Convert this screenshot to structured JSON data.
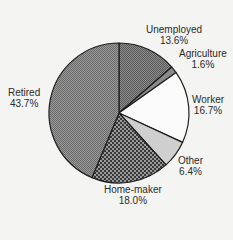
{
  "chart_data": {
    "type": "pie",
    "title": "",
    "start_angle_deg": 0,
    "direction": "clockwise",
    "slices": [
      {
        "label": "Unemployed",
        "value": 13.6,
        "value_label": "13.6%",
        "pattern": "fine-dots-dark"
      },
      {
        "label": "Agriculture",
        "value": 1.6,
        "value_label": "1.6%",
        "pattern": "medium-gray"
      },
      {
        "label": "Worker",
        "value": 16.7,
        "value_label": "16.7%",
        "pattern": "white"
      },
      {
        "label": "Other",
        "value": 6.4,
        "value_label": "6.4%",
        "pattern": "light-gray"
      },
      {
        "label": "Home-maker",
        "value": 18.0,
        "value_label": "18.0%",
        "pattern": "coarse-dots-dark"
      },
      {
        "label": "Retired",
        "value": 43.7,
        "value_label": "43.7%",
        "pattern": "fine-checker-gray"
      }
    ],
    "legend": "none (labels placed outside slices)"
  },
  "labels": {
    "unemployed": {
      "name": "Unemployed",
      "pct": "13.6%"
    },
    "agriculture": {
      "name": "Agriculture",
      "pct": "1.6%"
    },
    "worker": {
      "name": "Worker",
      "pct": "16.7%"
    },
    "other": {
      "name": "Other",
      "pct": "6.4%"
    },
    "homemaker": {
      "name": "Home-maker",
      "pct": "18.0%"
    },
    "retired": {
      "name": "Retired",
      "pct": "43.7%"
    }
  }
}
